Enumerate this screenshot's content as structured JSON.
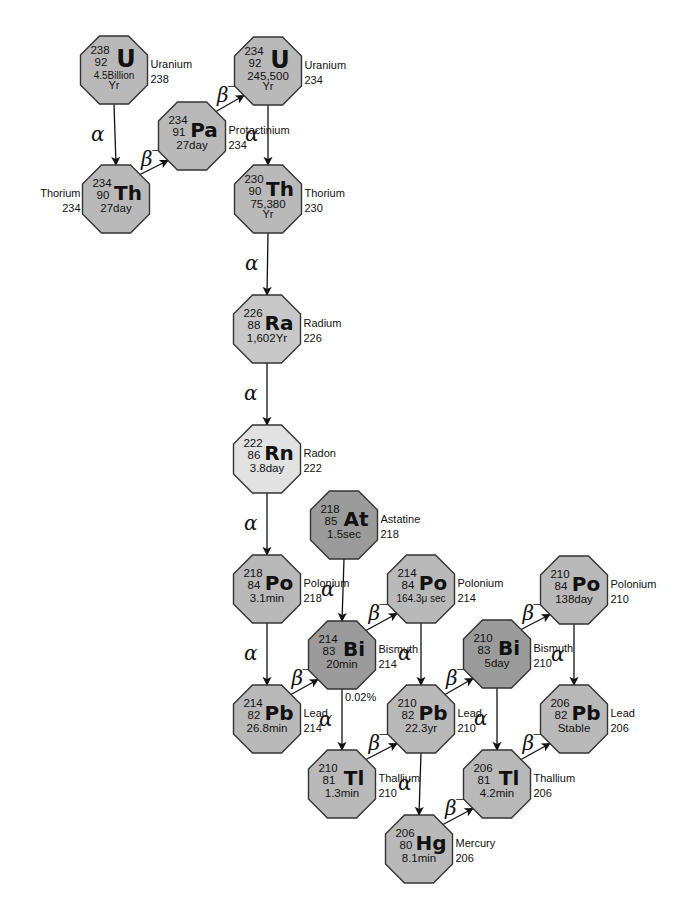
{
  "diagram": {
    "colors": {
      "default_fill": "#b9b9b9",
      "dark_fill": "#9b9b9b",
      "radium_fill": "#c8c8c8",
      "radon_fill": "#e2e2e2",
      "stroke": "#333333",
      "arrow": "#111111"
    },
    "nodes": [
      {
        "id": "U238",
        "symbol": "U",
        "mass": "238",
        "z": "92",
        "half_life": "4.5Billion",
        "half_life_2": "Yr",
        "name": "Uranium",
        "name_num": "238",
        "cx": 114,
        "cy": 70,
        "fill": "default_fill",
        "label_side": "right"
      },
      {
        "id": "Th234",
        "symbol": "Th",
        "mass": "234",
        "z": "90",
        "half_life": "27day",
        "half_life_2": "",
        "name": "Thorium",
        "name_num": "234",
        "cx": 116,
        "cy": 199,
        "fill": "default_fill",
        "label_side": "left"
      },
      {
        "id": "Pa234",
        "symbol": "Pa",
        "mass": "234",
        "z": "91",
        "half_life": "27day",
        "half_life_2": "",
        "name": "Protactinium",
        "name_num": "234",
        "cx": 192,
        "cy": 136,
        "fill": "default_fill",
        "label_side": "right"
      },
      {
        "id": "U234",
        "symbol": "U",
        "mass": "234",
        "z": "92",
        "half_life": "245,500",
        "half_life_2": "Yr",
        "name": "Uranium",
        "name_num": "234",
        "cx": 268,
        "cy": 71,
        "fill": "default_fill",
        "label_side": "right"
      },
      {
        "id": "Th230",
        "symbol": "Th",
        "mass": "230",
        "z": "90",
        "half_life": "75,380",
        "half_life_2": "Yr",
        "name": "Thorium",
        "name_num": "230",
        "cx": 268,
        "cy": 199,
        "fill": "default_fill",
        "label_side": "right"
      },
      {
        "id": "Ra226",
        "symbol": "Ra",
        "mass": "226",
        "z": "88",
        "half_life": "1,602Yr",
        "half_life_2": "",
        "name": "Radium",
        "name_num": "226",
        "cx": 267,
        "cy": 329,
        "fill": "radium_fill",
        "label_side": "right"
      },
      {
        "id": "Rn222",
        "symbol": "Rn",
        "mass": "222",
        "z": "86",
        "half_life": "3.8day",
        "half_life_2": "",
        "name": "Radon",
        "name_num": "222",
        "cx": 267,
        "cy": 459,
        "fill": "radon_fill",
        "label_side": "right"
      },
      {
        "id": "At218",
        "symbol": "At",
        "mass": "218",
        "z": "85",
        "half_life": "1.5sec",
        "half_life_2": "",
        "name": "Astatine",
        "name_num": "218",
        "cx": 344,
        "cy": 525,
        "fill": "dark_fill",
        "label_side": "right"
      },
      {
        "id": "Po218",
        "symbol": "Po",
        "mass": "218",
        "z": "84",
        "half_life": "3.1min",
        "half_life_2": "",
        "name": "Polonium",
        "name_num": "218",
        "cx": 267,
        "cy": 589,
        "fill": "default_fill",
        "label_side": "right"
      },
      {
        "id": "Bi214",
        "symbol": "Bi",
        "mass": "214",
        "z": "83",
        "half_life": "20min",
        "half_life_2": "",
        "name": "Bismuth",
        "name_num": "214",
        "cx": 342,
        "cy": 655,
        "fill": "dark_fill",
        "label_side": "right"
      },
      {
        "id": "Po214",
        "symbol": "Po",
        "mass": "214",
        "z": "84",
        "half_life": "164.3μ sec",
        "half_life_2": "",
        "name": "Polonium",
        "name_num": "214",
        "cx": 421,
        "cy": 589,
        "fill": "default_fill",
        "label_side": "right"
      },
      {
        "id": "Pb214",
        "symbol": "Pb",
        "mass": "214",
        "z": "82",
        "half_life": "26.8min",
        "half_life_2": "",
        "name": "Lead",
        "name_num": "214",
        "cx": 267,
        "cy": 719,
        "fill": "default_fill",
        "label_side": "right"
      },
      {
        "id": "Pb210",
        "symbol": "Pb",
        "mass": "210",
        "z": "82",
        "half_life": "22.3yr",
        "half_life_2": "",
        "name": "Lead",
        "name_num": "210",
        "cx": 421,
        "cy": 719,
        "fill": "default_fill",
        "label_side": "right"
      },
      {
        "id": "Tl210",
        "symbol": "Tl",
        "mass": "210",
        "z": "81",
        "half_life": "1.3min",
        "half_life_2": "",
        "name": "Thallium",
        "name_num": "210",
        "cx": 342,
        "cy": 784,
        "fill": "default_fill",
        "label_side": "right"
      },
      {
        "id": "Bi210",
        "symbol": "Bi",
        "mass": "210",
        "z": "83",
        "half_life": "5day",
        "half_life_2": "",
        "name": "Bismuth",
        "name_num": "210",
        "cx": 497,
        "cy": 654,
        "fill": "dark_fill",
        "label_side": "right"
      },
      {
        "id": "Po210",
        "symbol": "Po",
        "mass": "210",
        "z": "84",
        "half_life": "138day",
        "half_life_2": "",
        "name": "Polonium",
        "name_num": "210",
        "cx": 574,
        "cy": 590,
        "fill": "default_fill",
        "label_side": "right"
      },
      {
        "id": "Hg206",
        "symbol": "Hg",
        "mass": "206",
        "z": "80",
        "half_life": "8.1min",
        "half_life_2": "",
        "name": "Mercury",
        "name_num": "206",
        "cx": 419,
        "cy": 849,
        "fill": "default_fill",
        "label_side": "right"
      },
      {
        "id": "Tl206",
        "symbol": "Tl",
        "mass": "206",
        "z": "81",
        "half_life": "4.2min",
        "half_life_2": "",
        "name": "Thallium",
        "name_num": "206",
        "cx": 497,
        "cy": 784,
        "fill": "default_fill",
        "label_side": "right"
      },
      {
        "id": "Pb206",
        "symbol": "Pb",
        "mass": "206",
        "z": "82",
        "half_life": "Stable",
        "half_life_2": "",
        "name": "Lead",
        "name_num": "206",
        "cx": 574,
        "cy": 719,
        "fill": "default_fill",
        "label_side": "right"
      }
    ],
    "edges": [
      {
        "from": "U238",
        "to": "Th234",
        "type": "alpha"
      },
      {
        "from": "Th234",
        "to": "Pa234",
        "type": "beta"
      },
      {
        "from": "Pa234",
        "to": "U234",
        "type": "beta"
      },
      {
        "from": "U234",
        "to": "Th230",
        "type": "alpha"
      },
      {
        "from": "Th230",
        "to": "Ra226",
        "type": "alpha"
      },
      {
        "from": "Ra226",
        "to": "Rn222",
        "type": "alpha"
      },
      {
        "from": "Rn222",
        "to": "Po218",
        "type": "alpha"
      },
      {
        "from": "At218",
        "to": "Bi214",
        "type": "alpha"
      },
      {
        "from": "Po218",
        "to": "Pb214",
        "type": "alpha"
      },
      {
        "from": "Pb214",
        "to": "Bi214",
        "type": "beta"
      },
      {
        "from": "Bi214",
        "to": "Po214",
        "type": "beta"
      },
      {
        "from": "Bi214",
        "to": "Tl210",
        "type": "alpha",
        "note": "0.02%"
      },
      {
        "from": "Po214",
        "to": "Pb210",
        "type": "alpha"
      },
      {
        "from": "Tl210",
        "to": "Pb210",
        "type": "beta"
      },
      {
        "from": "Pb210",
        "to": "Bi210",
        "type": "beta"
      },
      {
        "from": "Pb210",
        "to": "Hg206",
        "type": "alpha"
      },
      {
        "from": "Bi210",
        "to": "Po210",
        "type": "beta"
      },
      {
        "from": "Bi210",
        "to": "Tl206",
        "type": "alpha"
      },
      {
        "from": "Po210",
        "to": "Pb206",
        "type": "alpha"
      },
      {
        "from": "Hg206",
        "to": "Tl206",
        "type": "beta"
      },
      {
        "from": "Tl206",
        "to": "Pb206",
        "type": "beta"
      }
    ],
    "decay_labels": {
      "alpha": "α",
      "beta": "β⁻"
    }
  }
}
